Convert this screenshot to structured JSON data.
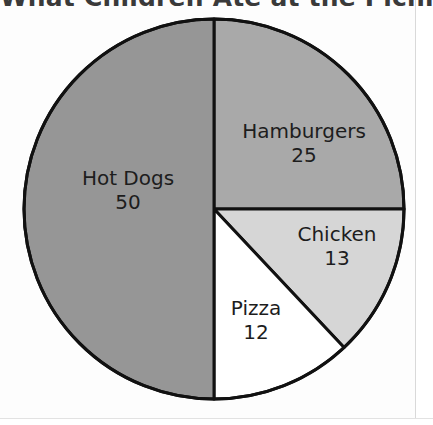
{
  "chart_data": {
    "type": "pie",
    "title": "What Children Ate at the Picnic",
    "categories": [
      "Hamburgers",
      "Chicken",
      "Pizza",
      "Hot Dogs"
    ],
    "values": [
      25,
      13,
      12,
      50
    ],
    "total": 100,
    "slices": [
      {
        "label": "Hamburgers",
        "value": "25",
        "value_number": 25,
        "color": "#a9a9a9",
        "start_angle_deg": 0,
        "end_angle_deg": 90
      },
      {
        "label": "Chicken",
        "value": "13",
        "value_number": 13,
        "color": "#d6d6d6",
        "start_angle_deg": 90,
        "end_angle_deg": 136.8
      },
      {
        "label": "Pizza",
        "value": "12",
        "value_number": 12,
        "color": "#ffffff",
        "start_angle_deg": 136.8,
        "end_angle_deg": 180
      },
      {
        "label": "Hot Dogs",
        "value": "50",
        "value_number": 50,
        "color": "#969696",
        "start_angle_deg": 180,
        "end_angle_deg": 360
      }
    ],
    "legend": "none",
    "grid": false,
    "xlabel": "",
    "ylabel": "",
    "outline_color": "#111111",
    "label_color": "#1d1d1d",
    "title_color": "#3a3a3a",
    "background_color": "#fdfdfd"
  },
  "geometry": {
    "center_x": 214,
    "center_y": 209,
    "radius": 190,
    "stroke_width": 3
  }
}
